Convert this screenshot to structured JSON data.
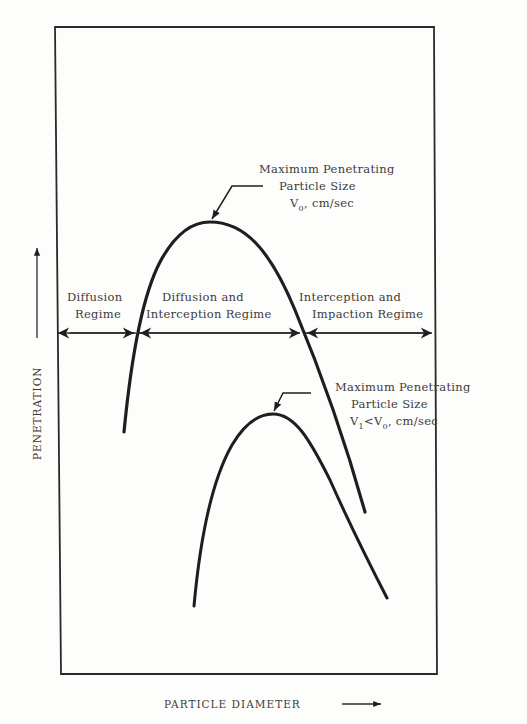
{
  "figure": {
    "x_axis_label": "PARTICLE DIAMETER",
    "y_axis_label": "PENETRATION",
    "colors": {
      "ink": "#1e1e1e",
      "text": "#3c3c3c",
      "background": "#fdfdfb"
    }
  },
  "regimes": [
    {
      "line1": "Diffusion",
      "line2": "Regime"
    },
    {
      "line1": "Diffusion and",
      "line2": "Interception Regime"
    },
    {
      "line1": "Interception and",
      "line2": "Impaction Regime"
    }
  ],
  "annotations": {
    "upper": {
      "line1": "Maximum Penetrating",
      "line2": "Particle Size",
      "v": "V",
      "v_sub": "0",
      "units": ", cm/sec"
    },
    "lower": {
      "line1": "Maximum Penetrating",
      "line2": "Particle Size",
      "v1": "V",
      "v1_sub": "1",
      "lt": "<V",
      "v0_sub": "0",
      "units": ",  cm/sec"
    }
  },
  "curves": [
    {
      "name": "velocity V0",
      "peak_label": "Maximum Penetrating Particle Size V0"
    },
    {
      "name": "velocity V1 < V0",
      "peak_label": "Maximum Penetrating Particle Size V1<V0"
    }
  ]
}
